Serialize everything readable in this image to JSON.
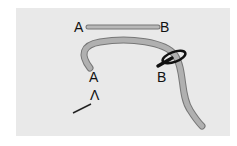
{
  "diagram": {
    "colors": {
      "panel": "#e9e9e9",
      "thread_fill": "#b0b0b0",
      "thread_outline": "#777777",
      "needle": "#111111"
    },
    "labels": {
      "top_left": "A",
      "top_right": "B",
      "curve_start": "A",
      "loop_point": "B",
      "lower_mark": "Λ"
    }
  }
}
